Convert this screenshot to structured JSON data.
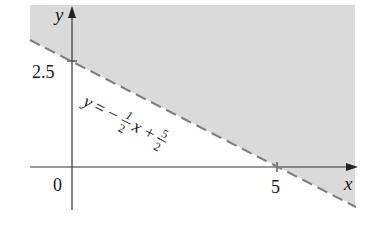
{
  "figure": {
    "type": "inequality-region-graph",
    "shading_color": "#d9d9d9",
    "line_color": "#7a7a7a",
    "axis_color": "#333333",
    "axes": {
      "x_label": "x",
      "y_label": "y",
      "origin_label": "0"
    },
    "ticks": {
      "y_tick_label": "2.5",
      "x_tick_label": "5"
    },
    "boundary_line": {
      "equation_prefix": "y = −",
      "frac1_num": "1",
      "frac1_den": "2",
      "middle": "x +",
      "frac2_num": "5",
      "frac2_den": "2",
      "style": "dashed",
      "y_intercept": 2.5,
      "x_intercept": 5
    },
    "shaded_region": "above the line (y > -1/2 x + 5/2)"
  }
}
